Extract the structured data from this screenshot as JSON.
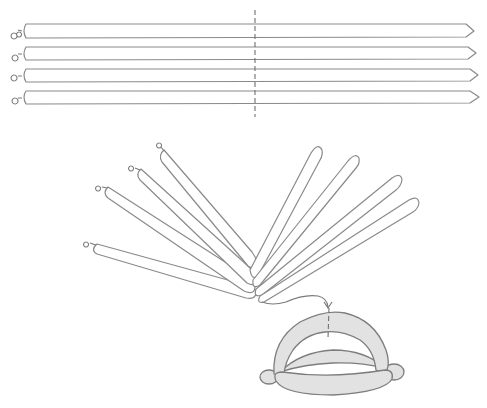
{
  "diagram": {
    "type": "balloon-twisting-instructions",
    "colors": {
      "stroke": "#8a8a8a",
      "fill_plain": "#ffffff",
      "fill_shaded": "#e2e2e2",
      "background": "#ffffff"
    },
    "steps": [
      {
        "id": "step-1",
        "description": "Four inflated long balloons laid side by side, with a dashed line marking the midpoint",
        "balloon_count": 4,
        "midpoint_marker": "dashed-line"
      },
      {
        "id": "step-2",
        "description": "Balloons twisted together at the middle and fanned out (four to the left with knots, four tips to the right)",
        "left_arms": 4,
        "right_arms": 4,
        "arrow": "curved-arrow-to-next-step"
      },
      {
        "id": "step-3",
        "description": "Resulting shaded frame: arched balloon over a crossbar and base balloon, dashed midline on arch",
        "shaded": true
      }
    ]
  }
}
